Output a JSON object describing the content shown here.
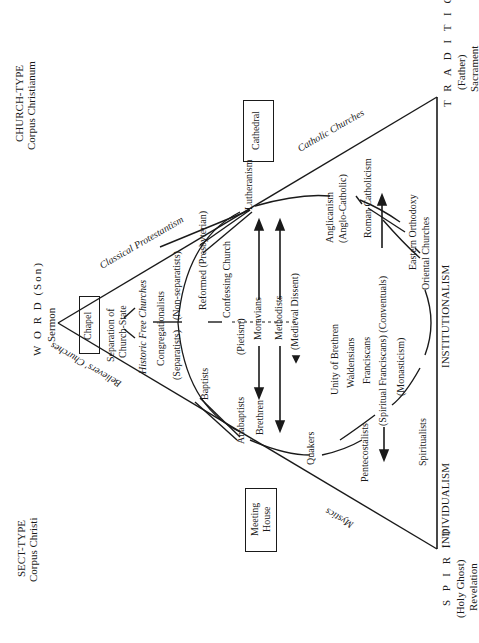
{
  "corners": {
    "church_type": {
      "title": "CHURCH-TYPE",
      "subtitle": "Corpus Christianum"
    },
    "sect_type": {
      "title": "SECT-TYPE",
      "subtitle": "Corpus Christi"
    }
  },
  "vertices": {
    "word": {
      "title": "W O R D",
      "person": "(Son)",
      "means": "Sermon"
    },
    "tradition": {
      "title": "T R A D I T I O N",
      "person": "(Father)",
      "means": "Sacrament"
    },
    "spirit": {
      "title": "S P I R I T",
      "person": "(Holy Ghost)",
      "means": "Revelation"
    }
  },
  "side_labels": {
    "classical_protestantism": "Classical Protestantism",
    "believers_churches": "Believers' Churches",
    "catholic_churches": "Catholic Churches",
    "mystics": "Mystics",
    "institutionalism": "INSTITUTIONALISM",
    "individualism": "INDIVIDUALISM"
  },
  "buildings": {
    "chapel": "Chapel",
    "cathedral": "Cathedral",
    "meeting_house_1": "Meeting",
    "meeting_house_2": "House"
  },
  "groups": {
    "separation_1": "Separation of",
    "separation_2": "Church-State",
    "historic_free": "Historic Free Churches",
    "congregationalists": "Congregationalists",
    "separatists": "(Separatists)",
    "non_separatists": "(Non-separatists)",
    "reformed": "Reformed (Presbyterian)",
    "confessing": "Confessing Church",
    "baptists": "Baptists",
    "lutheranism": "Lutheranism",
    "pietism": "(Pietism)",
    "moravians": "Moravians",
    "methodists": "Methodists",
    "medieval_dissent": "(Medieval Dissent)",
    "anabaptists": "Anabaptists",
    "brethren": "Brethren",
    "quakers": "Quakers",
    "pentecostalists": "Pentecostalists",
    "unity_of_brethren": "Unity of Brethren",
    "waldensians": "Waldensians",
    "franciscans": "Franciscans",
    "spiritual_conventuals": "(Spiritual Franciscans) (Conventuals)",
    "monasticism": "(Monasticism)",
    "spiritualists": "Spiritualists",
    "anglicanism": "Anglicanism",
    "anglo_catholic": "(Anglo-Catholic)",
    "roman_catholicism": "Roman Catholicism",
    "eastern_orthodoxy": "Eastern Orthodoxy",
    "oriental_churches": "Oriental Churches"
  }
}
